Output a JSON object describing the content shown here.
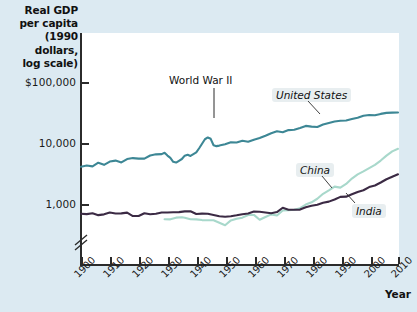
{
  "chart_data": {
    "type": "line",
    "title": "Real GDP per capita (1990 dollars, log scale)",
    "title_lines": [
      "Real GDP",
      "per capita",
      "(1990 dollars,",
      "log scale)"
    ],
    "xlabel": "Year",
    "ylabel": "Real GDP per capita (1990 dollars, log scale)",
    "yscale": "log",
    "ylim": [
      600,
      100000
    ],
    "ytick_labels": [
      "$100,000",
      "10,000",
      "1,000"
    ],
    "ytick_values": [
      100000,
      10000,
      1000
    ],
    "y_axis_break": true,
    "xlim": [
      1900,
      2010
    ],
    "xtick_labels": [
      "1900",
      "1910",
      "1920",
      "1930",
      "1940",
      "1950",
      "1960",
      "1970",
      "1980",
      "1990",
      "2000",
      "2010"
    ],
    "xtick_values": [
      1900,
      1910,
      1920,
      1930,
      1940,
      1950,
      1960,
      1970,
      1980,
      1990,
      2000,
      2010
    ],
    "grid": false,
    "legend_position": "inline-labels",
    "annotations": [
      {
        "text": "World War II",
        "x": 1944,
        "y": 11500,
        "label_x": 1938,
        "label_y": 40000
      }
    ],
    "colors": {
      "united_states": "#3d8795",
      "china": "#a8d8cb",
      "india": "#3b2a44",
      "background": "#dceaf2",
      "plot_background": "#ffffff",
      "axis": "#2b2b2b",
      "label_chip": "#e8eef0"
    },
    "series": [
      {
        "name": "United States",
        "color": "#3d8795",
        "label_text": "United States",
        "x": [
          1900,
          1902,
          1904,
          1906,
          1908,
          1910,
          1912,
          1914,
          1916,
          1918,
          1920,
          1922,
          1924,
          1926,
          1928,
          1929,
          1930,
          1931,
          1932,
          1933,
          1934,
          1935,
          1936,
          1937,
          1938,
          1939,
          1940,
          1941,
          1942,
          1943,
          1944,
          1945,
          1946,
          1947,
          1948,
          1950,
          1952,
          1954,
          1956,
          1958,
          1960,
          1962,
          1964,
          1966,
          1968,
          1970,
          1972,
          1974,
          1976,
          1978,
          1980,
          1982,
          1984,
          1986,
          1988,
          1990,
          1992,
          1994,
          1996,
          1998,
          2000,
          2002,
          2004,
          2006,
          2008,
          2010
        ],
        "y": [
          4091,
          4269,
          4134,
          4749,
          4385,
          4964,
          5144,
          4799,
          5461,
          5659,
          5552,
          5540,
          6233,
          6517,
          6569,
          6899,
          6213,
          5691,
          4908,
          4777,
          5114,
          5467,
          6204,
          6430,
          6126,
          6561,
          7010,
          8206,
          9741,
          11518,
          12333,
          11709,
          9197,
          8886,
          9065,
          9561,
          10316,
          10209,
          10914,
          10477,
          11328,
          12065,
          13145,
          14475,
          15546,
          15030,
          16283,
          16491,
          17567,
          19061,
          18577,
          18325,
          20106,
          21236,
          22499,
          23201,
          23400,
          24830,
          26000,
          28000,
          28702,
          28500,
          30000,
          31178,
          31500,
          31700
        ],
        "note": "US real GDP per capita rises from ~$4,100 in 1900 to ~$31,700 in 2010, with Great Depression dip in 1933 and a World War II spike peaking ~1944"
      },
      {
        "name": "China",
        "color": "#a8d8cb",
        "label_text": "China",
        "x": [
          1929,
          1931,
          1933,
          1935,
          1936,
          1938,
          1940,
          1942,
          1944,
          1946,
          1950,
          1952,
          1954,
          1956,
          1958,
          1960,
          1962,
          1964,
          1966,
          1968,
          1970,
          1972,
          1974,
          1976,
          1978,
          1980,
          1982,
          1984,
          1986,
          1988,
          1990,
          1992,
          1994,
          1996,
          1998,
          2000,
          2002,
          2004,
          2006,
          2008,
          2010
        ],
        "y": [
          562,
          560,
          597,
          606,
          597,
          562,
          560,
          545,
          540,
          540,
          448,
          538,
          572,
          597,
          662,
          662,
          552,
          613,
          676,
          648,
          783,
          795,
          806,
          853,
          979,
          1067,
          1219,
          1471,
          1672,
          1925,
          1858,
          2132,
          2610,
          3057,
          3425,
          3873,
          4379,
          5158,
          6200,
          7300,
          8032
        ],
        "note": "China data begins around 1929; stagnant near $550-650 until 1960s, then rapid growth after 1978 reforms reaching ~$8,000 by 2010"
      },
      {
        "name": "India",
        "color": "#3b2a44",
        "label_text": "India",
        "x": [
          1900,
          1902,
          1904,
          1906,
          1908,
          1910,
          1912,
          1914,
          1916,
          1918,
          1920,
          1922,
          1924,
          1926,
          1928,
          1930,
          1932,
          1934,
          1936,
          1938,
          1940,
          1942,
          1944,
          1946,
          1948,
          1950,
          1952,
          1954,
          1956,
          1958,
          1960,
          1962,
          1964,
          1966,
          1968,
          1970,
          1972,
          1974,
          1976,
          1978,
          1980,
          1982,
          1984,
          1986,
          1988,
          1990,
          1992,
          1994,
          1996,
          1998,
          2000,
          2002,
          2004,
          2006,
          2008,
          2010
        ],
        "y": [
          691,
          683,
          706,
          657,
          676,
          726,
          700,
          701,
          722,
          634,
          635,
          704,
          678,
          693,
          727,
          726,
          732,
          736,
          757,
          760,
          686,
          695,
          693,
          660,
          629,
          619,
          629,
          652,
          680,
          697,
          753,
          746,
          726,
          706,
          737,
          868,
          806,
          807,
          810,
          883,
          938,
          973,
          1049,
          1093,
          1185,
          1309,
          1319,
          1441,
          1577,
          1681,
          1892,
          2010,
          2249,
          2541,
          2800,
          3069
        ],
        "note": "India flat near $700 for first half of century, then steady growth from 1970s to ~$3,100 by 2010"
      }
    ]
  },
  "axis_break_marker": "//",
  "figure_caption": ""
}
